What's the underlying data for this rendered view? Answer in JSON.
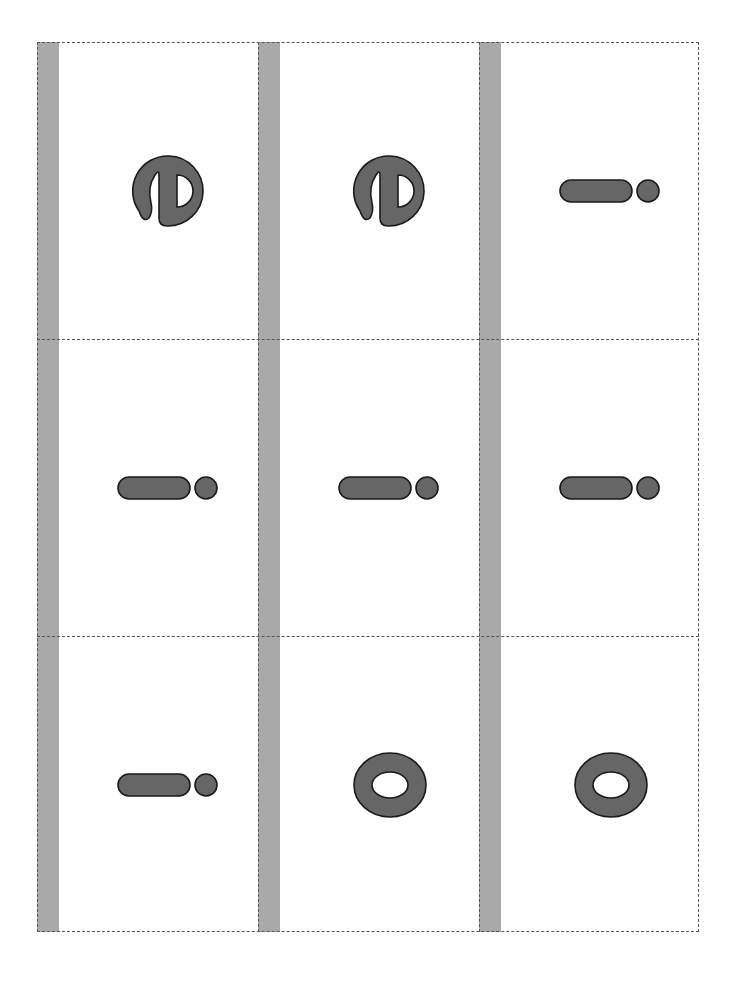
{
  "sheet": {
    "type": "letter-card-sheet",
    "columns": 3,
    "rows": 3,
    "colors": {
      "strip": "#a9a9a9",
      "glyph_fill": "#666666",
      "glyph_stroke": "#1a1a1a",
      "cut_line": "#555555",
      "background": "#ffffff"
    },
    "cards": [
      {
        "row": 0,
        "col": 0,
        "letter": "e",
        "glyph": "e-rotated-icon"
      },
      {
        "row": 0,
        "col": 1,
        "letter": "e",
        "glyph": "e-rotated-icon"
      },
      {
        "row": 0,
        "col": 2,
        "letter": "i",
        "glyph": "i-rotated-icon"
      },
      {
        "row": 1,
        "col": 0,
        "letter": "i",
        "glyph": "i-rotated-icon"
      },
      {
        "row": 1,
        "col": 1,
        "letter": "i",
        "glyph": "i-rotated-icon"
      },
      {
        "row": 1,
        "col": 2,
        "letter": "i",
        "glyph": "i-rotated-icon"
      },
      {
        "row": 2,
        "col": 0,
        "letter": "i",
        "glyph": "i-rotated-icon"
      },
      {
        "row": 2,
        "col": 1,
        "letter": "o",
        "glyph": "o-icon"
      },
      {
        "row": 2,
        "col": 2,
        "letter": "o",
        "glyph": "o-icon"
      }
    ]
  }
}
